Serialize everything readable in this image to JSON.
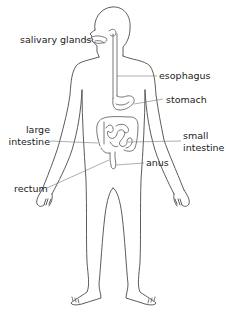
{
  "diagram": {
    "line_color": "#4a4a4a",
    "text_color": "#222222",
    "labels": {
      "salivary_glands": "salivary glands",
      "esophagus": "esophagus",
      "stomach": "stomach",
      "large_intestine_1": "large",
      "large_intestine_2": "intestine",
      "small_intestine_1": "small",
      "small_intestine_2": "intestine",
      "anus": "anus",
      "rectum": "rectum"
    }
  }
}
